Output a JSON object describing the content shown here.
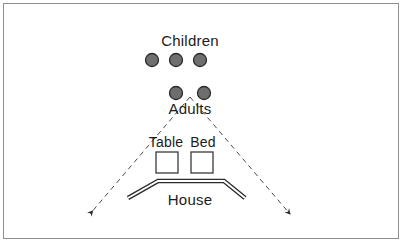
{
  "figure": {
    "frame_color": "#8e8e8e",
    "background": "#ffffff"
  },
  "groups": {
    "children": {
      "label": "Children",
      "count": 3,
      "marker_shape": "circle",
      "fill": "#6e6e6e",
      "stroke": "#2b2b2b",
      "positions": [
        {
          "cx": 152,
          "cy": 60
        },
        {
          "cx": 176,
          "cy": 60
        },
        {
          "cx": 200,
          "cy": 60
        }
      ],
      "radius": 6.5
    },
    "adults": {
      "label": "Adults",
      "count": 2,
      "marker_shape": "circle",
      "fill": "#6e6e6e",
      "stroke": "#2b2b2b",
      "positions": [
        {
          "cx": 176,
          "cy": 93
        },
        {
          "cx": 204,
          "cy": 93
        }
      ],
      "radius": 6.5
    }
  },
  "objects": [
    {
      "label": "Table",
      "shape": "square",
      "fill": "#ffffff",
      "stroke": "#3a3a3a",
      "x": 156,
      "y": 152,
      "size": 22
    },
    {
      "label": "Bed",
      "shape": "square",
      "fill": "#ffffff",
      "stroke": "#3a3a3a",
      "x": 191,
      "y": 152,
      "size": 22
    }
  ],
  "house": {
    "label": "House",
    "shape": "chevron-double-line",
    "stroke": "#2b2b2b",
    "points": "128,198 158,181 224,181 245,198"
  },
  "view_cone": {
    "style": "dashed",
    "stroke": "#4a4a4a",
    "apex": {
      "x": 190,
      "y": 97
    },
    "left_end": {
      "x": 88,
      "y": 216
    },
    "right_end": {
      "x": 292,
      "y": 216
    },
    "arrowheads": 2
  }
}
